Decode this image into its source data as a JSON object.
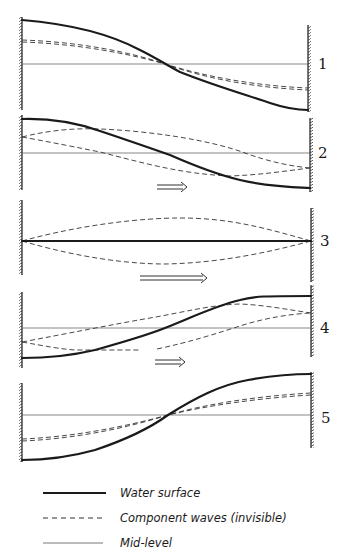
{
  "colors": {
    "ink": "#1a1a1a",
    "ink_light": "#555555",
    "background": "#ffffff"
  },
  "panels": [
    {
      "number": "1",
      "number_pos": [
        318,
        69
      ],
      "left_wall": {
        "x": 22,
        "y1": 17,
        "y2": 110
      },
      "right_wall": {
        "x": 308,
        "y1": 25,
        "y2": 112
      },
      "mid_level": {
        "y": 64,
        "x1": 22,
        "x2": 308
      },
      "water_surface": "M22,20 C70,24 110,34 140,50 C160,60 168,66 180,72 C215,86 250,96 270,103 C285,108 295,110 308,110",
      "component_waves": [
        "M22,40 C80,42 130,52 165,64 C210,78 260,86 308,88",
        "M22,42 C80,44 130,54 165,64 C210,80 260,88 308,90"
      ],
      "arrow": null
    },
    {
      "number": "2",
      "number_pos": [
        318,
        158
      ],
      "left_wall": {
        "x": 22,
        "y1": 115,
        "y2": 190
      },
      "right_wall": {
        "x": 310,
        "y1": 118,
        "y2": 192
      },
      "mid_level": {
        "y": 153,
        "x1": 22,
        "x2": 310
      },
      "water_surface": "M22,119 C55,118 80,124 100,131 C130,141 150,148 170,155 C195,166 215,174 240,180 C265,186 290,187 310,188",
      "component_waves": [
        "M22,137 C50,130 75,128 100,129 C150,131 210,140 245,153 C270,162 290,166 310,168",
        "M22,137 C50,142 80,148 100,152 C140,162 180,174 230,176 C260,175 285,171 310,168"
      ],
      "arrow": {
        "x1": 157,
        "x2": 187,
        "y": 187
      }
    },
    {
      "number": "3",
      "number_pos": [
        320,
        246
      ],
      "left_wall": {
        "x": 22,
        "y1": 200,
        "y2": 275
      },
      "right_wall": {
        "x": 311,
        "y1": 208,
        "y2": 282
      },
      "mid_level": {
        "y": 241,
        "x1": 22,
        "x2": 311
      },
      "water_surface": "M22,241 L311,241",
      "component_waves": [
        "M22,241 C80,225 140,218 180,218 C230,218 265,228 311,241",
        "M22,241 C80,258 130,264 165,264 C220,263 270,252 311,241"
      ],
      "arrow": {
        "x1": 140,
        "x2": 207,
        "y": 278
      }
    },
    {
      "number": "4",
      "number_pos": [
        320,
        333
      ],
      "left_wall": {
        "x": 22,
        "y1": 292,
        "y2": 368
      },
      "right_wall": {
        "x": 311,
        "y1": 285,
        "y2": 357
      },
      "mid_level": {
        "y": 328,
        "x1": 22,
        "x2": 311
      },
      "water_surface": "M22,358 C45,358 70,356 95,350 C120,343 145,336 165,328 C195,316 215,306 240,300 C255,296 265,296 311,296",
      "component_waves": [
        "M22,342 C70,333 110,325 150,318 C185,312 210,305 240,304 C265,305 290,310 311,313",
        "M22,342 C45,346 60,349 75,350 L140,350 M157,349 C190,342 215,334 240,326 C265,318 290,314 311,313"
      ],
      "arrow": {
        "x1": 155,
        "x2": 185,
        "y": 362
      }
    },
    {
      "number": "5",
      "number_pos": [
        321,
        423
      ],
      "left_wall": {
        "x": 22,
        "y1": 383,
        "y2": 462
      },
      "right_wall": {
        "x": 311,
        "y1": 372,
        "y2": 448
      },
      "mid_level": {
        "y": 415,
        "x1": 22,
        "x2": 311
      },
      "water_surface": "M22,460 C50,460 70,457 95,450 C125,440 150,428 168,415 C195,398 220,385 248,380 C270,376 290,374 311,374",
      "component_waves": [
        "M22,439 C70,437 120,428 168,415 C210,403 260,396 311,393",
        "M22,441 C70,439 120,430 168,415 C210,405 260,398 311,395"
      ],
      "arrow": null
    }
  ],
  "legend": {
    "items": [
      {
        "style": "solid",
        "label": "Water surface",
        "y": 493
      },
      {
        "style": "dashed",
        "label": "Component waves (invisible)",
        "y": 518
      },
      {
        "style": "thin",
        "label": "Mid-level",
        "y": 543
      }
    ]
  }
}
